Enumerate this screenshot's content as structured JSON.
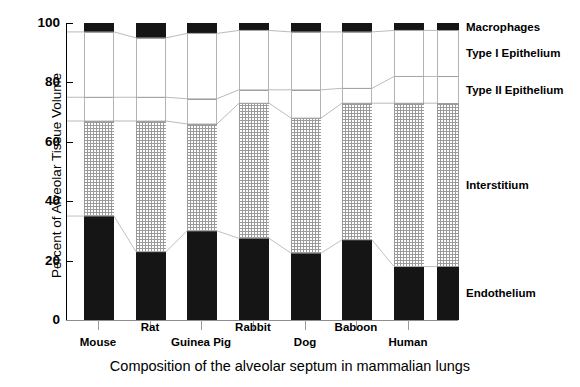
{
  "chart_data": {
    "type": "bar",
    "subtype": "stacked-bar-100-percent",
    "title": "Composition of the alveolar septum in mammalian lungs",
    "xlabel": "",
    "ylabel": "Percent of Alveolar Tissue Volume",
    "ylim": [
      0,
      100
    ],
    "yticks": [
      0,
      20,
      40,
      60,
      80,
      100
    ],
    "grid": false,
    "legend_position": "right-outside",
    "categories": [
      "Mouse",
      "Rat",
      "Guinea Pig",
      "Rabbit",
      "Dog",
      "Baboon",
      "Human"
    ],
    "series": [
      {
        "name": "Endothelium",
        "values": [
          35.0,
          23.0,
          30.0,
          27.5,
          22.5,
          27.0,
          18.0
        ]
      },
      {
        "name": "Interstitium",
        "values": [
          32.0,
          44.0,
          36.0,
          45.5,
          45.5,
          46.0,
          55.0
        ]
      },
      {
        "name": "Type II Epithelium",
        "values": [
          8.0,
          8.0,
          8.5,
          4.5,
          9.5,
          5.0,
          9.0
        ]
      },
      {
        "name": "Type I Epithelium",
        "values": [
          22.0,
          20.0,
          22.0,
          20.0,
          19.5,
          19.0,
          15.5
        ]
      },
      {
        "name": "Macrophages",
        "values": [
          3.0,
          5.0,
          3.5,
          2.5,
          3.0,
          3.0,
          2.5
        ]
      }
    ],
    "cumulative_boundaries": {
      "endothelium_top": [
        35.0,
        23.0,
        30.0,
        27.5,
        22.5,
        27.0,
        18.0
      ],
      "interstitium_top": [
        67.0,
        67.0,
        66.0,
        73.0,
        68.0,
        73.0,
        73.0
      ],
      "type2_top": [
        75.0,
        75.0,
        74.5,
        77.5,
        77.5,
        78.0,
        82.0
      ],
      "type1_top": [
        97.0,
        95.0,
        96.5,
        97.5,
        97.0,
        97.0,
        97.5
      ]
    }
  },
  "axes": {
    "y_title": "Percent of Alveolar Tissue Volume",
    "y_tick_labels": [
      "100",
      "80",
      "60",
      "40",
      "20",
      "0"
    ],
    "caption": "Composition of the alveolar septum in mammalian lungs"
  },
  "legend": {
    "items": [
      {
        "label": "Macrophages",
        "swatch": "solid-black",
        "color": "#151515"
      },
      {
        "label": "Type I Epithelium",
        "swatch": "white",
        "color": "#ffffff"
      },
      {
        "label": "Type II Epithelium",
        "swatch": "white",
        "color": "#ffffff"
      },
      {
        "label": "Interstitium",
        "swatch": "dotted-grid",
        "color": "#9a9a9a"
      },
      {
        "label": "Endothelium",
        "swatch": "solid-black",
        "color": "#151515"
      }
    ]
  },
  "x_labels": [
    {
      "label": "Mouse",
      "row": 1
    },
    {
      "label": "Rat",
      "row": 0
    },
    {
      "label": "Guinea Pig",
      "row": 1
    },
    {
      "label": "Rabbit",
      "row": 0
    },
    {
      "label": "Dog",
      "row": 1
    },
    {
      "label": "Baboon",
      "row": 0
    },
    {
      "label": "Human",
      "row": 1
    }
  ]
}
